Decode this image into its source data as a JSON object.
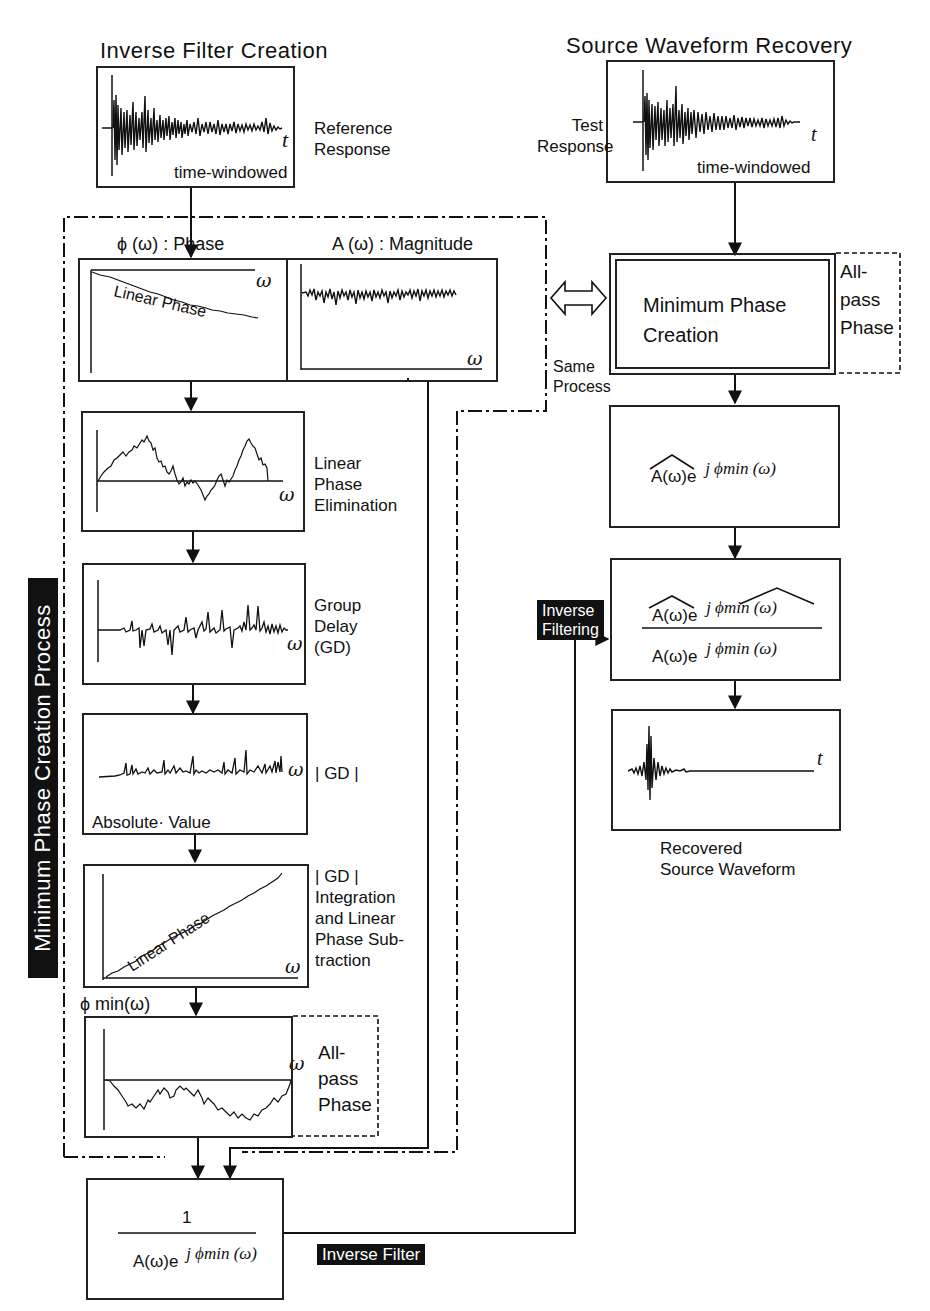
{
  "titles": {
    "left": "Inverse Filter Creation",
    "right": "Source Waveform Recovery"
  },
  "reference": {
    "label": "Reference\nResponse",
    "window_label": "time-windowed",
    "axis": "t"
  },
  "test": {
    "label": "Test\nResponse",
    "window_label": "time-windowed",
    "axis": "t"
  },
  "process_group": {
    "vertical_label": "Minimum Phase Creation Process",
    "same_process": "Same\nProcess"
  },
  "phase_panel": {
    "header": "ϕ (ω) :  Phase",
    "curve_label": "Linear Phase",
    "axis": "ω"
  },
  "magnitude_panel": {
    "header": "A (ω) : Magnitude",
    "axis": "ω"
  },
  "steps": [
    {
      "id": "linear-phase-elimination",
      "label": "Linear\nPhase\nElimination",
      "axis": "ω"
    },
    {
      "id": "group-delay",
      "label": "Group\nDelay\n(GD)",
      "axis": "ω"
    },
    {
      "id": "abs-gd",
      "label": "| GD |",
      "inner_label": "Absolute· Value",
      "axis": "ω"
    },
    {
      "id": "integration",
      "label": "| GD |\nIntegration\nand  Linear\nPhase  Sub-\ntraction",
      "inner_label": "Linear Phase",
      "axis": "ω"
    },
    {
      "id": "phi-min",
      "header": "ϕ  min(ω)",
      "side_label": "All-\npass\nPhase",
      "axis": "ω"
    }
  ],
  "min_phase_creation": {
    "label": "Minimum  Phase\nCreation",
    "side_label": "All-\npass\nPhase"
  },
  "estimated_spectrum": {
    "base": "A(ω)e",
    "exponent": "j  ϕmin (ω)"
  },
  "inverse_filtering": {
    "tag": "Inverse\nFiltering",
    "numerator_base": "A(ω)e",
    "numerator_exp": "j  ϕmin (ω)",
    "denominator_base": "A(ω)e",
    "denominator_exp": "j  ϕmin (ω)"
  },
  "recovered": {
    "label": "Recovered\nSource  Waveform",
    "axis": "t"
  },
  "inverse_filter": {
    "numerator": "1",
    "denominator_base": "A(ω)e",
    "denominator_exp": "j  ϕmin (ω)",
    "tag": "Inverse  Filter"
  }
}
